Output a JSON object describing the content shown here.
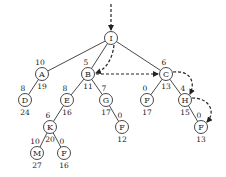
{
  "diagram": {
    "type": "search-tree",
    "nodes": [
      {
        "id": "n0",
        "label": "I",
        "x": 111,
        "y": 38,
        "top": "",
        "bottom": ""
      },
      {
        "id": "n1",
        "label": "A",
        "x": 42,
        "y": 74,
        "top": "10",
        "bottom": "19"
      },
      {
        "id": "n2",
        "label": "B",
        "x": 88,
        "y": 74,
        "top": "5",
        "bottom": "11"
      },
      {
        "id": "n3",
        "label": "C",
        "x": 166,
        "y": 74,
        "top": "6",
        "bottom": "13"
      },
      {
        "id": "n4",
        "label": "D",
        "x": 25,
        "y": 100,
        "top": "8",
        "bottom": "24"
      },
      {
        "id": "n5",
        "label": "E",
        "x": 67,
        "y": 100,
        "top": "8",
        "bottom": "16"
      },
      {
        "id": "n6",
        "label": "G",
        "x": 106,
        "y": 100,
        "top": "7",
        "bottom": "17"
      },
      {
        "id": "n7",
        "label": "F",
        "x": 147,
        "y": 100,
        "top": "0",
        "bottom": "17"
      },
      {
        "id": "n8",
        "label": "H",
        "x": 185,
        "y": 100,
        "top": "4",
        "bottom": "15"
      },
      {
        "id": "n9",
        "label": "K",
        "x": 50,
        "y": 127,
        "top": "6",
        "bottom": "20"
      },
      {
        "id": "n10",
        "label": "F",
        "x": 122,
        "y": 127,
        "top": "0",
        "bottom": "12"
      },
      {
        "id": "n11",
        "label": "F",
        "x": 201,
        "y": 127,
        "top": "0",
        "bottom": "13"
      },
      {
        "id": "n12",
        "label": "M",
        "x": 37,
        "y": 153,
        "top": "10",
        "bottom": "27"
      },
      {
        "id": "n13",
        "label": "F",
        "x": 64,
        "y": 153,
        "top": "0",
        "bottom": "16"
      }
    ],
    "edges": [
      [
        "n0",
        "n1"
      ],
      [
        "n0",
        "n2"
      ],
      [
        "n0",
        "n3"
      ],
      [
        "n1",
        "n4"
      ],
      [
        "n2",
        "n5"
      ],
      [
        "n2",
        "n6"
      ],
      [
        "n3",
        "n7"
      ],
      [
        "n3",
        "n8"
      ],
      [
        "n5",
        "n9"
      ],
      [
        "n6",
        "n10"
      ],
      [
        "n8",
        "n11"
      ],
      [
        "n9",
        "n12"
      ],
      [
        "n9",
        "n13"
      ]
    ],
    "search_path": [
      "start",
      "I",
      "B",
      "C",
      "H",
      "F"
    ]
  }
}
